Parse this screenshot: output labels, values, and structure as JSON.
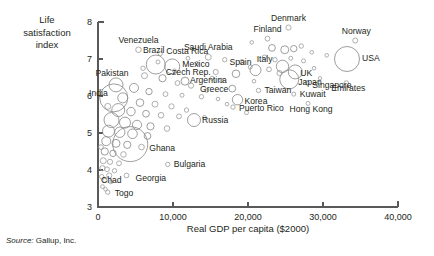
{
  "figure": {
    "source_prefix": "Source:",
    "source_text": "Gallup, Inc."
  },
  "chart_data": {
    "type": "scatter",
    "title": "",
    "subtitle": "",
    "xlabel": "Real GDP per capita ($2000)",
    "ylabel": "Life satisfaction index",
    "ylabel_lines": [
      "Life",
      "satisfaction",
      "index"
    ],
    "xlim": [
      0,
      40000
    ],
    "ylim": [
      3,
      8
    ],
    "xticks": [
      0,
      10000,
      20000,
      30000,
      40000
    ],
    "xtick_labels": [
      "0",
      "10,000",
      "20,000",
      "30,000",
      "40,000"
    ],
    "yticks": [
      3,
      4,
      5,
      6,
      7,
      8
    ],
    "ytick_labels": [
      "3",
      "4",
      "5",
      "6",
      "7",
      "8"
    ],
    "grid": false,
    "legend": null,
    "marker": "open-circle",
    "size_encoding": "population",
    "points": [
      {
        "name": "Denmark",
        "x": 25400,
        "y": 7.85,
        "r": 2.6,
        "label_dx": 0,
        "label_dy": -7,
        "label_anchor": "middle"
      },
      {
        "name": "Finland",
        "x": 22600,
        "y": 7.55,
        "r": 2.4,
        "label_dx": 0,
        "label_dy": -7,
        "label_anchor": "middle"
      },
      {
        "name": "Norway",
        "x": 34300,
        "y": 7.5,
        "r": 2.5,
        "label_dx": 1,
        "label_dy": -7,
        "label_anchor": "middle"
      },
      {
        "name": "Venezuela",
        "x": 5400,
        "y": 7.25,
        "r": 2.8,
        "label_dx": 0,
        "label_dy": -7,
        "label_anchor": "middle"
      },
      {
        "name": "Costa Rica",
        "x": 8300,
        "y": 7.15,
        "r": 2.2,
        "label_dx": 6,
        "label_dy": 1,
        "label_anchor": "start"
      },
      {
        "name": "Saudi Arabia",
        "x": 14700,
        "y": 7.05,
        "r": 3.0,
        "label_dx": 0,
        "label_dy": -7,
        "label_anchor": "middle"
      },
      {
        "name": "USA",
        "x": 33200,
        "y": 7.0,
        "r": 12.5,
        "label_dx": 15,
        "label_dy": 2,
        "label_anchor": "start"
      },
      {
        "name": "Brazil",
        "x": 7700,
        "y": 6.85,
        "r": 9.5,
        "label_dx": -2,
        "label_dy": -12,
        "label_anchor": "middle"
      },
      {
        "name": "Italy",
        "x": 24600,
        "y": 6.8,
        "r": 6.2,
        "label_dx": -10,
        "label_dy": -4,
        "label_anchor": "end"
      },
      {
        "name": "Mexico",
        "x": 9900,
        "y": 6.8,
        "r": 7.5,
        "label_dx": 10,
        "label_dy": 1,
        "label_anchor": "start"
      },
      {
        "name": "Czech Rep.",
        "x": 15700,
        "y": 6.65,
        "r": 2.6,
        "label_dx": -5,
        "label_dy": 3,
        "label_anchor": "end"
      },
      {
        "name": "Spain",
        "x": 21000,
        "y": 6.7,
        "r": 5.5,
        "label_dx": -4,
        "label_dy": -5,
        "label_anchor": "end"
      },
      {
        "name": "UK",
        "x": 26300,
        "y": 6.65,
        "r": 7.0,
        "label_dx": 5,
        "label_dy": 4,
        "label_anchor": "start"
      },
      {
        "name": "Japan",
        "x": 25500,
        "y": 6.45,
        "r": 9.5,
        "label_dx": 9,
        "label_dy": 6,
        "label_anchor": "start"
      },
      {
        "name": "Singapore",
        "x": 27900,
        "y": 6.35,
        "r": 2.2,
        "label_dx": 5,
        "label_dy": 5,
        "label_anchor": "start"
      },
      {
        "name": "Emirates",
        "x": 33100,
        "y": 6.35,
        "r": 2.3,
        "label_dx": 2,
        "label_dy": 8,
        "label_anchor": "middle"
      },
      {
        "name": "Argentina",
        "x": 11600,
        "y": 6.4,
        "r": 4.0,
        "label_dx": 5,
        "label_dy": 2,
        "label_anchor": "start"
      },
      {
        "name": "Pakistan",
        "x": 2400,
        "y": 6.3,
        "r": 7.0,
        "label_dx": -4,
        "label_dy": -9,
        "label_anchor": "middle"
      },
      {
        "name": "Greece",
        "x": 17900,
        "y": 6.2,
        "r": 3.4,
        "label_dx": -4,
        "label_dy": 3,
        "label_anchor": "end"
      },
      {
        "name": "Taiwan",
        "x": 21400,
        "y": 6.15,
        "r": 2.2,
        "label_dx": 6,
        "label_dy": 3,
        "label_anchor": "start"
      },
      {
        "name": "Kuwait",
        "x": 26100,
        "y": 6.05,
        "r": 2.0,
        "label_dx": 6,
        "label_dy": 3,
        "label_anchor": "start"
      },
      {
        "name": "India",
        "x": 2100,
        "y": 5.95,
        "r": 14.0,
        "label_dx": -6,
        "label_dy": -2,
        "label_anchor": "end"
      },
      {
        "name": "Korea",
        "x": 18600,
        "y": 5.9,
        "r": 5.2,
        "label_dx": 7,
        "label_dy": 4,
        "label_anchor": "start"
      },
      {
        "name": "Hong Kong",
        "x": 28000,
        "y": 5.8,
        "r": 2.0,
        "label_dx": 3,
        "label_dy": 9,
        "label_anchor": "middle"
      },
      {
        "name": "Puerto Rico",
        "x": 18000,
        "y": 5.7,
        "r": 2.2,
        "label_dx": 6,
        "label_dy": 4,
        "label_anchor": "start"
      },
      {
        "name": "Russia",
        "x": 12800,
        "y": 5.35,
        "r": 6.5,
        "label_dx": 8,
        "label_dy": 3,
        "label_anchor": "start"
      },
      {
        "name": "Ghana",
        "x": 4300,
        "y": 4.7,
        "r": 17.5,
        "label_dx": 19,
        "label_dy": 7,
        "label_anchor": "start"
      },
      {
        "name": "Bulgaria",
        "x": 9300,
        "y": 4.15,
        "r": 2.2,
        "label_dx": 6,
        "label_dy": 3,
        "label_anchor": "start"
      },
      {
        "name": "Georgia",
        "x": 3800,
        "y": 3.85,
        "r": 2.4,
        "label_dx": 9,
        "label_dy": 5,
        "label_anchor": "start"
      },
      {
        "name": "Chad",
        "x": 1500,
        "y": 3.85,
        "r": 2.6,
        "label_dx": 2,
        "label_dy": 7,
        "label_anchor": "middle"
      },
      {
        "name": "Togo",
        "x": 1300,
        "y": 3.4,
        "r": 2.2,
        "label_dx": 7,
        "label_dy": 4,
        "label_anchor": "start"
      }
    ],
    "unlabeled_points": [
      {
        "x": 23200,
        "y": 7.3,
        "r": 3.4
      },
      {
        "x": 24900,
        "y": 7.25,
        "r": 4.0
      },
      {
        "x": 26100,
        "y": 7.28,
        "r": 3.2
      },
      {
        "x": 27100,
        "y": 7.35,
        "r": 2.2
      },
      {
        "x": 22200,
        "y": 7.05,
        "r": 2.2
      },
      {
        "x": 23600,
        "y": 6.98,
        "r": 2.2
      },
      {
        "x": 25700,
        "y": 7.02,
        "r": 2.0
      },
      {
        "x": 27400,
        "y": 6.95,
        "r": 2.0
      },
      {
        "x": 16900,
        "y": 6.98,
        "r": 2.2
      },
      {
        "x": 19200,
        "y": 6.92,
        "r": 2.4
      },
      {
        "x": 13200,
        "y": 6.88,
        "r": 2.0
      },
      {
        "x": 20300,
        "y": 6.78,
        "r": 2.0
      },
      {
        "x": 22800,
        "y": 6.72,
        "r": 2.4
      },
      {
        "x": 24200,
        "y": 6.62,
        "r": 2.6
      },
      {
        "x": 28800,
        "y": 6.75,
        "r": 1.8
      },
      {
        "x": 18400,
        "y": 6.6,
        "r": 3.8
      },
      {
        "x": 15200,
        "y": 6.48,
        "r": 2.0
      },
      {
        "x": 16400,
        "y": 6.42,
        "r": 2.2
      },
      {
        "x": 20800,
        "y": 6.4,
        "r": 1.8
      },
      {
        "x": 29600,
        "y": 6.48,
        "r": 1.7
      },
      {
        "x": 6200,
        "y": 6.55,
        "r": 3.0
      },
      {
        "x": 8600,
        "y": 6.48,
        "r": 3.6
      },
      {
        "x": 10600,
        "y": 6.35,
        "r": 2.4
      },
      {
        "x": 12400,
        "y": 6.28,
        "r": 2.6
      },
      {
        "x": 4800,
        "y": 6.22,
        "r": 4.5
      },
      {
        "x": 6800,
        "y": 6.12,
        "r": 3.2
      },
      {
        "x": 9000,
        "y": 6.05,
        "r": 2.4
      },
      {
        "x": 11200,
        "y": 6.02,
        "r": 2.0
      },
      {
        "x": 13800,
        "y": 5.98,
        "r": 2.2
      },
      {
        "x": 16000,
        "y": 5.92,
        "r": 1.8
      },
      {
        "x": 3300,
        "y": 5.95,
        "r": 5.0
      },
      {
        "x": 5600,
        "y": 5.82,
        "r": 3.8
      },
      {
        "x": 7600,
        "y": 5.78,
        "r": 3.0
      },
      {
        "x": 9800,
        "y": 5.72,
        "r": 2.6
      },
      {
        "x": 2700,
        "y": 5.62,
        "r": 6.5
      },
      {
        "x": 4400,
        "y": 5.58,
        "r": 4.2
      },
      {
        "x": 6400,
        "y": 5.52,
        "r": 3.4
      },
      {
        "x": 8400,
        "y": 5.48,
        "r": 2.8
      },
      {
        "x": 10800,
        "y": 5.45,
        "r": 2.4
      },
      {
        "x": 1800,
        "y": 5.35,
        "r": 7.5
      },
      {
        "x": 3600,
        "y": 5.28,
        "r": 5.5
      },
      {
        "x": 5200,
        "y": 5.22,
        "r": 4.6
      },
      {
        "x": 7000,
        "y": 5.18,
        "r": 3.6
      },
      {
        "x": 9200,
        "y": 5.12,
        "r": 2.8
      },
      {
        "x": 1400,
        "y": 5.05,
        "r": 6.0
      },
      {
        "x": 2900,
        "y": 5.02,
        "r": 5.2
      },
      {
        "x": 4600,
        "y": 4.98,
        "r": 4.8
      },
      {
        "x": 6600,
        "y": 4.92,
        "r": 3.4
      },
      {
        "x": 1100,
        "y": 4.78,
        "r": 4.5
      },
      {
        "x": 2400,
        "y": 4.72,
        "r": 4.0
      },
      {
        "x": 3900,
        "y": 4.68,
        "r": 3.6
      },
      {
        "x": 5800,
        "y": 4.62,
        "r": 2.8
      },
      {
        "x": 900,
        "y": 4.5,
        "r": 3.6
      },
      {
        "x": 2000,
        "y": 4.45,
        "r": 3.2
      },
      {
        "x": 3400,
        "y": 4.42,
        "r": 2.8
      },
      {
        "x": 700,
        "y": 4.25,
        "r": 3.0
      },
      {
        "x": 1600,
        "y": 4.22,
        "r": 2.6
      },
      {
        "x": 2800,
        "y": 4.18,
        "r": 2.4
      },
      {
        "x": 600,
        "y": 4.05,
        "r": 2.6
      },
      {
        "x": 1200,
        "y": 4.02,
        "r": 2.4
      },
      {
        "x": 2200,
        "y": 3.98,
        "r": 2.2
      },
      {
        "x": 500,
        "y": 3.82,
        "r": 2.2
      },
      {
        "x": 900,
        "y": 3.72,
        "r": 2.0
      },
      {
        "x": 1700,
        "y": 3.68,
        "r": 2.0
      },
      {
        "x": 600,
        "y": 3.55,
        "r": 1.9
      },
      {
        "x": 1000,
        "y": 3.48,
        "r": 1.8
      },
      {
        "x": 400,
        "y": 4.62,
        "r": 2.4
      },
      {
        "x": 1300,
        "y": 5.72,
        "r": 3.0
      },
      {
        "x": 14500,
        "y": 6.15,
        "r": 2.0
      },
      {
        "x": 17200,
        "y": 5.78,
        "r": 1.8
      },
      {
        "x": 19800,
        "y": 5.55,
        "r": 2.0
      },
      {
        "x": 11800,
        "y": 5.62,
        "r": 2.2
      },
      {
        "x": 14200,
        "y": 5.42,
        "r": 2.0
      },
      {
        "x": 8000,
        "y": 6.92,
        "r": 2.0
      },
      {
        "x": 12000,
        "y": 7.02,
        "r": 1.9
      },
      {
        "x": 6000,
        "y": 6.75,
        "r": 2.2
      },
      {
        "x": 10200,
        "y": 6.68,
        "r": 1.9
      },
      {
        "x": 30500,
        "y": 7.1,
        "r": 1.8
      },
      {
        "x": 20500,
        "y": 7.45,
        "r": 1.8
      },
      {
        "x": 28500,
        "y": 7.18,
        "r": 1.8
      }
    ]
  }
}
